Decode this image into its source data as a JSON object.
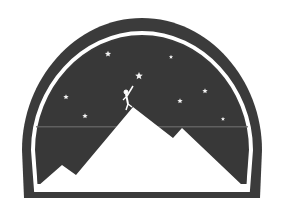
{
  "logo": {
    "description": "Mountain climber dome emblem",
    "colors": {
      "background": "#ffffff",
      "dome": "#3b3b3b",
      "ring": "#ffffff",
      "sky": "#383838",
      "mountain": "#ffffff",
      "star": "#f2f2f2",
      "scanline": "#6a6a6a"
    },
    "stars": [
      {
        "x": 108,
        "y": 54,
        "r": 3.2
      },
      {
        "x": 171,
        "y": 57,
        "r": 2.2
      },
      {
        "x": 139,
        "y": 76,
        "r": 4.0
      },
      {
        "x": 66,
        "y": 97,
        "r": 2.8
      },
      {
        "x": 205,
        "y": 91,
        "r": 2.8
      },
      {
        "x": 180,
        "y": 101,
        "r": 2.8
      },
      {
        "x": 85,
        "y": 116,
        "r": 2.8
      },
      {
        "x": 223,
        "y": 119,
        "r": 2.2
      }
    ]
  }
}
